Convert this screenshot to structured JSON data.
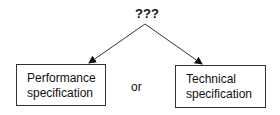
{
  "diagram": {
    "root_label": "???",
    "connector_label": "or",
    "nodes": [
      {
        "id": "performance",
        "label_line1": "Performance",
        "label_line2": "specification"
      },
      {
        "id": "technical",
        "label_line1": "Technical",
        "label_line2": "specification"
      }
    ],
    "edges": [
      {
        "from": "root",
        "to": "performance",
        "style": "arrow"
      },
      {
        "from": "root",
        "to": "technical",
        "style": "arrow"
      }
    ],
    "colors": {
      "line": "#333333",
      "background": "#ffffff",
      "text": "#111111"
    }
  }
}
